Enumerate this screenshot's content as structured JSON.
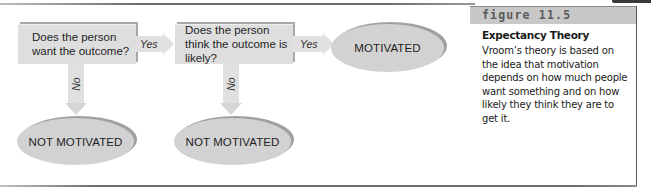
{
  "figure": {
    "label": "figure 11.5",
    "title": "Expectancy Theory",
    "caption": "Vroom’s theory is based on the idea that motivation depends on how much people want something and on how likely they think they are to get it."
  },
  "flowchart": {
    "decisions": [
      {
        "id": "want",
        "text": "Does the person want the outcome?"
      },
      {
        "id": "likely",
        "text": "Does the person think the outcome is likely?"
      }
    ],
    "outcomes": {
      "motivated": "MOTIVATED",
      "not_motivated_1": "NOT MOTIVATED",
      "not_motivated_2": "NOT MOTIVATED"
    },
    "edges": [
      {
        "from": "want",
        "to": "likely",
        "label": "Yes",
        "direction": "right"
      },
      {
        "from": "likely",
        "to": "motivated",
        "label": "Yes",
        "direction": "right"
      },
      {
        "from": "want",
        "to": "not_motivated_1",
        "label": "No",
        "direction": "down"
      },
      {
        "from": "likely",
        "to": "not_motivated_2",
        "label": "No",
        "direction": "down"
      }
    ]
  },
  "colors": {
    "box_fill": "#dedede",
    "oval_fill": "#d2d2d2",
    "arrow_fill": "#e0e0e0",
    "header_band": "#c8c8c8"
  }
}
